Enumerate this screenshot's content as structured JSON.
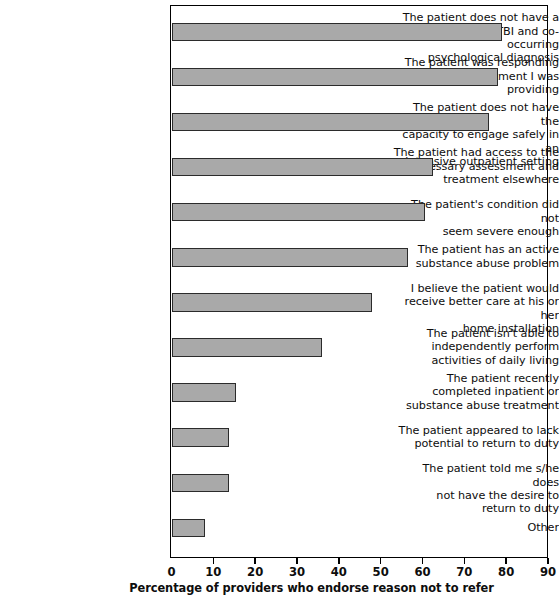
{
  "chart_data": {
    "type": "bar",
    "orientation": "horizontal",
    "title": "",
    "xlabel": "Percentage of providers who endorse reason not to refer",
    "ylabel": "",
    "xlim": [
      0,
      90
    ],
    "xticks": [
      0,
      10,
      20,
      30,
      40,
      50,
      60,
      70,
      80,
      90
    ],
    "grid": false,
    "legend": false,
    "bar_color": "#a9a9a9",
    "bar_edge_color": "#2b2b2b",
    "categories": [
      "The patient does not have a\nhistory of TBI and co-occurring\npsychological diagnosis",
      "The patient was responding\nwell to the treatment I was\nproviding",
      "The patient does not have the\ncapacity to engage safely in an\nintensive outpatient setting",
      "The patient had access to the\nnecessary assessment and\ntreatment elsewhere",
      "The patient's condition did not\nseem severe enough",
      "The patient has an active\nsubstance abuse problem",
      "I believe the patient would\nreceive better care at his or her\nhome installation",
      "The patient isn't able to\nindependently perform\nactivities of daily living",
      "The patient recently\ncompleted inpatient or\nsubstance abuse treatment",
      "The patient appeared to lack\npotential to return to duty",
      "The patient told me s/he does\nnot have the desire to\nreturn to duty",
      "Other"
    ],
    "values": [
      79,
      78,
      76,
      62.5,
      60.5,
      56.5,
      48,
      36,
      15.5,
      13.7,
      13.7,
      8
    ]
  },
  "axis": {
    "tick_labels": [
      "0",
      "10",
      "20",
      "30",
      "40",
      "50",
      "60",
      "70",
      "80",
      "90"
    ],
    "title": "Percentage of providers who endorse reason not to refer"
  }
}
